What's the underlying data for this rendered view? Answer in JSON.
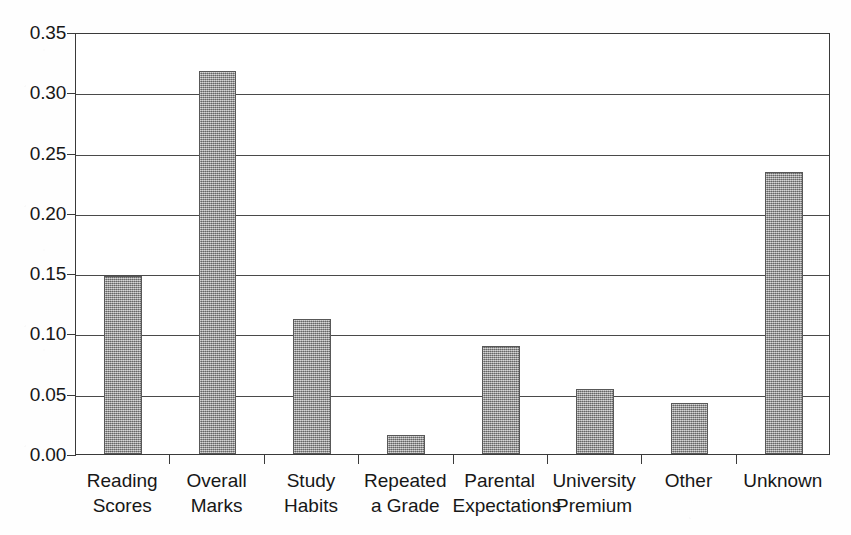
{
  "chart_data": {
    "type": "bar",
    "title": "",
    "subtitle": "",
    "xlabel": "",
    "ylabel": "",
    "categories": [
      "Reading\nScores",
      "Overall\nMarks",
      "Study\nHabits",
      "Repeated\na Grade",
      "Parental\nExpectations",
      "University\nPremium",
      "Other",
      "Unknown"
    ],
    "values": [
      0.148,
      0.318,
      0.112,
      0.016,
      0.09,
      0.054,
      0.042,
      0.234
    ],
    "ylim": [
      0.0,
      0.35
    ],
    "ytick_labels": [
      "0.00",
      "0.05",
      "0.10",
      "0.15",
      "0.20",
      "0.25",
      "0.30",
      "0.35"
    ],
    "ytick_values": [
      0.0,
      0.05,
      0.1,
      0.15,
      0.2,
      0.25,
      0.3,
      0.35
    ],
    "grid": "horizontal",
    "legend": "none",
    "bar_fill_color": "#8e8e8e",
    "bar_edge_color": "#585858",
    "axis_color": "#3a3a3a",
    "background_color": "#ffffff"
  }
}
